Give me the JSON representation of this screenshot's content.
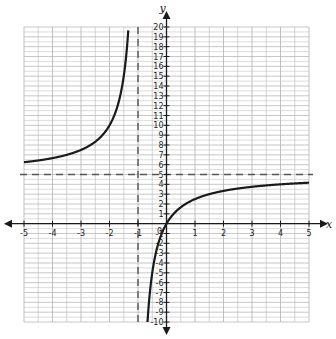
{
  "chart_data": {
    "type": "line",
    "title": "",
    "xlabel": "x",
    "ylabel": "y",
    "xlim": [
      -5,
      5
    ],
    "ylim": [
      -10,
      20
    ],
    "grid": true,
    "x_ticks": [
      -5,
      -4,
      -3,
      -2,
      -1,
      0,
      1,
      2,
      3,
      4,
      5
    ],
    "y_ticks": [
      -10,
      -9,
      -8,
      -7,
      -6,
      -5,
      -4,
      -3,
      -2,
      -1,
      0,
      1,
      2,
      3,
      4,
      5,
      6,
      7,
      8,
      9,
      10,
      11,
      12,
      13,
      14,
      15,
      16,
      17,
      18,
      19,
      20
    ],
    "x_tick_labels": [
      "-5",
      "-4",
      "-3",
      "-2",
      "-1",
      "1",
      "2",
      "3",
      "4",
      "5"
    ],
    "origin_label": "0",
    "function": "y = 5x/(x+1)",
    "asymptotes": {
      "vertical": {
        "x": -1,
        "style": "dashed"
      },
      "horizontal": {
        "y": 5,
        "style": "dashed"
      }
    },
    "series": [
      {
        "name": "left-branch",
        "x": [
          -5,
          -4.5,
          -4,
          -3.5,
          -3,
          -2.5,
          -2,
          -1.8,
          -1.6,
          -1.5,
          -1.4,
          -1.33
        ],
        "values": [
          6.25,
          6.43,
          6.67,
          7.0,
          7.5,
          8.33,
          10.0,
          11.25,
          13.33,
          15.0,
          17.5,
          20.15
        ]
      },
      {
        "name": "right-branch",
        "x": [
          -0.667,
          -0.6,
          -0.5,
          -0.4,
          -0.3,
          -0.2,
          -0.1,
          0,
          0.25,
          0.5,
          1,
          1.5,
          2,
          2.5,
          3,
          3.5,
          4,
          4.5,
          5
        ],
        "values": [
          -10.0,
          -7.5,
          -5.0,
          -3.33,
          -2.14,
          -1.25,
          -0.56,
          0,
          1.0,
          1.67,
          2.5,
          3.0,
          3.33,
          3.57,
          3.75,
          3.89,
          4.0,
          4.09,
          4.17
        ]
      }
    ],
    "colors": {
      "grid": "#b9b9b9",
      "axis": "#1a1a1a",
      "curve": "#1a1a1a",
      "asymptote": "#555555"
    }
  }
}
